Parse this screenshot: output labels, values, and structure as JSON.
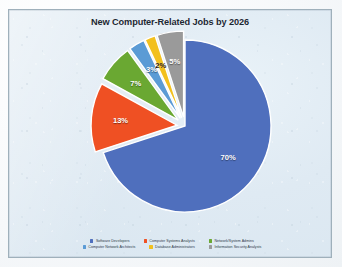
{
  "chart_data": {
    "type": "pie",
    "title": "New Computer-Related Jobs by 2026",
    "xlabel": "",
    "ylabel": "",
    "legend_position": "bottom",
    "grid": false,
    "categories": [
      "Software Developers",
      "Computer Systems Analysts",
      "Network/System Admins",
      "Computer Network Architects",
      "Database Administrators",
      "Information Security Analysts"
    ],
    "values": [
      70,
      13,
      7,
      3,
      2,
      5
    ],
    "labels": [
      "70%",
      "13%",
      "7%",
      "3%",
      "2%",
      "5%"
    ],
    "colors": [
      "#4f6fbd",
      "#ef5023",
      "#6aa832",
      "#5b9bd5",
      "#f2c01e",
      "#9a9a9a"
    ]
  },
  "legend": {
    "rows": [
      [
        {
          "label": "Software Developers",
          "color": "#4f6fbd"
        },
        {
          "label": "Computer Systems Analysts",
          "color": "#ef5023"
        },
        {
          "label": "Network/System Admins",
          "color": "#6aa832"
        }
      ],
      [
        {
          "label": "Computer Network Architects",
          "color": "#5b9bd5"
        },
        {
          "label": "Database Administrators",
          "color": "#f2c01e"
        },
        {
          "label": "Information Security Analysts",
          "color": "#9a9a9a"
        }
      ]
    ]
  },
  "style": {
    "frame_border": "#9fb0bb",
    "background": "#dfeaf3",
    "title_color": "#1b2733"
  }
}
